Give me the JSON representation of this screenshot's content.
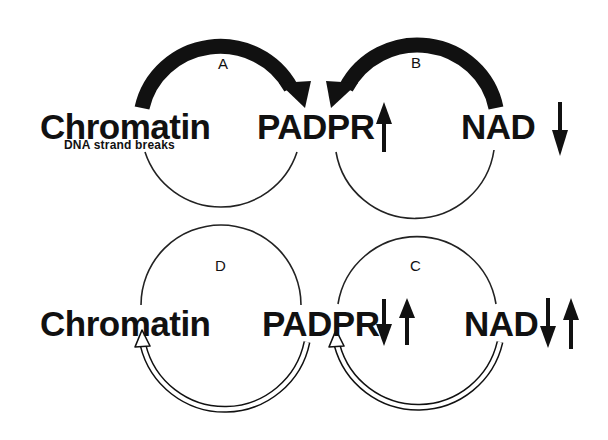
{
  "top_panel": {
    "nodes": {
      "chromatin": "Chromatin",
      "chromatin_sub": "DNA strand breaks",
      "padpr": "PADPR",
      "nad": "NAD"
    },
    "pathways": {
      "a": "A",
      "b": "B"
    },
    "indicators": {
      "padpr": "up-arrow",
      "nad": "down-arrow"
    },
    "flow_style": "thick-solid"
  },
  "bottom_panel": {
    "nodes": {
      "chromatin": "Chromatin",
      "padpr": "PADPR",
      "nad": "NAD"
    },
    "pathways": {
      "d": "D",
      "c": "C"
    },
    "indicators": {
      "padpr": "down-up-arrows",
      "nad": "down-up-arrows"
    },
    "flow_style": "hollow-double-line"
  },
  "colors": {
    "ink": "#111111",
    "background": "#ffffff"
  }
}
